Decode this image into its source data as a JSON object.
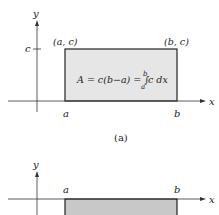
{
  "figure_a": {
    "y_label": "y",
    "x_label": "x",
    "c_tick": "c",
    "corner_left": "(a, c)",
    "corner_right": "(b, c)",
    "formula_lhs": "A = c(b−a) = ∫",
    "formula_upper": "b",
    "formula_lower": "a",
    "formula_rhs": "c dx",
    "a_label": "a",
    "b_label": "b",
    "caption": "(a)",
    "fill_color": "#e6e6e6"
  },
  "figure_b": {
    "y_label": "y",
    "x_label": "x",
    "a_label": "a",
    "b_label": "b",
    "fill_color": "#c8c8c8"
  }
}
